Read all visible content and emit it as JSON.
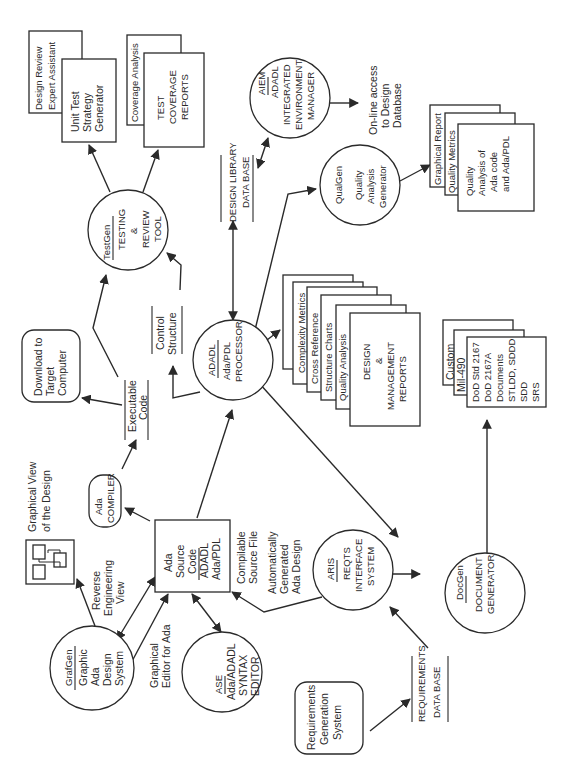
{
  "diagram": {
    "orientation": "rotated 90 degrees counter-clockwise (text reads bottom-to-top)",
    "nodes": {
      "grafgen": {
        "title": "GrafGen",
        "lines": [
          "Graphic",
          "Ada",
          "Design",
          "System"
        ]
      },
      "ase": {
        "title": "ASE",
        "lines": [
          "Ada/ADADL",
          "SYNTAX",
          "EDITOR"
        ]
      },
      "aris": {
        "title": "ARIS",
        "lines": [
          "REQTS",
          "INTERFACE",
          "SYSTEM"
        ]
      },
      "docgen": {
        "title": "DocGen",
        "lines": [
          "DOCUMENT",
          "GENERATOR"
        ]
      },
      "adadl": {
        "title": "ADADL",
        "lines": [
          "Ada/PDL",
          "PROCESSOR"
        ]
      },
      "testgen": {
        "title": "TestGen",
        "lines": [
          "TESTING",
          "&",
          "REVIEW",
          "TOOL"
        ]
      },
      "aiem": {
        "title": "AIEM",
        "lines": [
          "ADADL",
          "INTEGRATED",
          "ENVIRONMENT",
          "MANAGER"
        ]
      },
      "qualgen": {
        "title": "QualGen",
        "lines": [
          "Quality",
          "Analysis",
          "Generator"
        ]
      },
      "ada_source": {
        "lines_top": [
          "Ada",
          "Source",
          "Code"
        ],
        "lines_bottom": [
          "ADADL",
          "Ada/PDL"
        ]
      },
      "ada_compiler": {
        "lines": [
          "Ada",
          "COMPILER"
        ]
      },
      "download": {
        "lines": [
          "Download to",
          "Target",
          "Computer"
        ]
      },
      "req_gen": {
        "lines": [
          "Requirements",
          "Generation",
          "System"
        ]
      }
    },
    "datastores": {
      "executable_code": {
        "lines": [
          "Executable",
          "Code"
        ]
      },
      "control_structure": {
        "lines": [
          "Control",
          "Structure"
        ]
      },
      "design_library": {
        "lines": [
          "DESIGN LIBRARY",
          "DATA BASE"
        ]
      },
      "requirements_db": {
        "lines": [
          "REQUIREMENTS",
          "DATA BASE"
        ]
      }
    },
    "stacks": {
      "design_reports": {
        "tabs": [
          "Complexity  Metrics",
          "Cross Reference",
          "Structure  Charts",
          "Quality  Analysis"
        ],
        "front": [
          "DESIGN",
          "&",
          "MANAGEMENT",
          "REPORTS"
        ]
      },
      "documents": {
        "tabs": [
          "Custom",
          "Mil-490"
        ],
        "front": [
          "DoD  Std 2167",
          "DoD  2167A",
          "Documents",
          "STLDD, SDDD",
          "SDD",
          "SRS"
        ]
      },
      "test_outputs_left": {
        "tabs": [
          "Design  Review",
          "Expert  Assistant"
        ],
        "front": [
          "Unit  Test",
          "Strategy",
          "Generator"
        ]
      },
      "test_outputs_right": {
        "tabs": [
          "Coverage  Analysis"
        ],
        "front": [
          "TEST",
          "COVERAGE",
          "REPORTS"
        ]
      },
      "quality_outputs": {
        "tabs": [
          "Graphical  Report",
          "Quality  Metrics"
        ],
        "front": [
          "Quality",
          "Analysis  of",
          "Ada code",
          "and Ada/PDL"
        ]
      }
    },
    "graphical_view": {
      "lines": [
        "Graphical  View",
        "of the Design"
      ]
    },
    "labels": {
      "reverse_engineering": [
        "Reverse",
        "Engineering",
        "View"
      ],
      "graphical_editor": [
        "Graphical",
        "Editor for Ada"
      ],
      "compilable": [
        "Compilable",
        "Source File"
      ],
      "auto_generated": [
        "Automatically",
        "Generated",
        "Ada Design"
      ],
      "online_access": [
        "On-line access",
        "to Design",
        "Database"
      ]
    }
  }
}
